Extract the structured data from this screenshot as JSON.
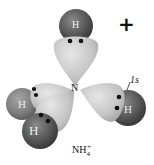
{
  "diagram": {
    "charge_symbol": "+",
    "central_atom": "N",
    "hydrogen_label": "H",
    "orbital_label": "1s",
    "formula": {
      "base": "NH",
      "subscript": "4",
      "superscript": "+"
    },
    "atoms": [
      {
        "id": "h-top",
        "label": "H"
      },
      {
        "id": "h-right",
        "label": "H"
      },
      {
        "id": "h-left-upper",
        "label": "H"
      },
      {
        "id": "h-left-lower",
        "label": "H"
      }
    ],
    "colors": {
      "lobe": "#c8c8c8",
      "hydrogen": "#555555",
      "electron": "#111111"
    }
  }
}
